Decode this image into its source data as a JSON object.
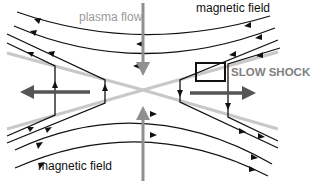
{
  "diagram": {
    "labels": {
      "plasma_flow": "plasma flow",
      "magnetic_field_top": "magnetic field",
      "magnetic_field_bottom": "magnetic field",
      "slow_shock": "SLOW SHOCK"
    },
    "colors": {
      "field_line": "#111111",
      "plasma_flow_arrow": "#909090",
      "slow_shock_line": "#c8c8c8",
      "outflow_arrow": "#555555",
      "shock_box": "#111111"
    },
    "elements": {
      "inflow_arrows": [
        "top-down",
        "bottom-up"
      ],
      "outflow_arrows": [
        "left",
        "right"
      ],
      "slow_shock_lines": 4,
      "field_lines_top": 2,
      "field_lines_bottom": 2,
      "reconnected_field_lines_left": 2,
      "reconnected_field_lines_right": 2,
      "highlight_box": "slow shock region"
    }
  }
}
